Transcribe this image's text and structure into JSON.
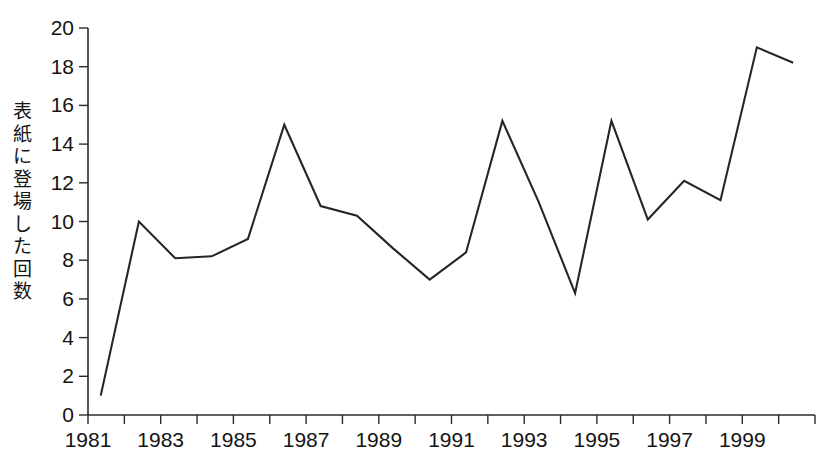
{
  "chart_data": {
    "type": "line",
    "title": "",
    "xlabel": "",
    "ylabel": "表紙に登場した回数",
    "xlim": [
      1981,
      2001
    ],
    "ylim": [
      0,
      20
    ],
    "grid": false,
    "legend": false,
    "x_tick_labels": [
      "1981",
      "1983",
      "1985",
      "1987",
      "1989",
      "1991",
      "1993",
      "1995",
      "1997",
      "1999"
    ],
    "x_tick_values": [
      1981,
      1983,
      1985,
      1987,
      1989,
      1991,
      1993,
      1995,
      1997,
      1999
    ],
    "x_minor_ticks": [
      1981,
      1982,
      1983,
      1984,
      1985,
      1986,
      1987,
      1988,
      1989,
      1990,
      1991,
      1992,
      1993,
      1994,
      1995,
      1996,
      1997,
      1998,
      1999,
      2000,
      2001
    ],
    "y_tick_labels": [
      "0",
      "2",
      "4",
      "6",
      "8",
      "10",
      "12",
      "14",
      "16",
      "18",
      "20"
    ],
    "y_tick_values": [
      0,
      2,
      4,
      6,
      8,
      10,
      12,
      14,
      16,
      18,
      20
    ],
    "x": [
      1981.35,
      1982.4,
      1983.4,
      1984.4,
      1985.4,
      1986.4,
      1987.4,
      1988.4,
      1989.4,
      1990.4,
      1991.4,
      1992.4,
      1993.4,
      1994.4,
      1995.4,
      1996.4,
      1997.4,
      1998.4,
      1999.4,
      2000.4
    ],
    "categories": [
      "1981",
      "1982",
      "1983",
      "1984",
      "1985",
      "1986",
      "1987",
      "1988",
      "1989",
      "1990",
      "1991",
      "1992",
      "1993",
      "1994",
      "1995",
      "1996",
      "1997",
      "1998",
      "1999",
      "2000"
    ],
    "values": [
      1.0,
      10.0,
      8.1,
      8.2,
      9.1,
      15.0,
      10.8,
      10.3,
      8.6,
      7.0,
      8.4,
      15.2,
      11.0,
      6.3,
      15.2,
      10.1,
      12.1,
      11.1,
      19.0,
      18.2
    ],
    "series": [
      {
        "name": "表紙に登場した回数",
        "values": [
          1.0,
          10.0,
          8.1,
          8.2,
          9.1,
          15.0,
          10.8,
          10.3,
          8.6,
          7.0,
          8.4,
          15.2,
          11.0,
          6.3,
          15.2,
          10.1,
          12.1,
          11.1,
          19.0,
          18.2
        ]
      }
    ],
    "line_color": "#262626",
    "background_color": "#ffffff"
  },
  "axis": {
    "y_label_text": "表紙に登場した回数",
    "y_label_chars": [
      "表",
      "紙",
      "に",
      "登",
      "場",
      "し",
      "た",
      "回",
      "数"
    ]
  }
}
